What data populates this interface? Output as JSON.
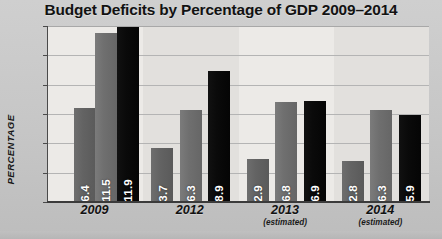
{
  "chart_data": {
    "type": "bar",
    "title": "Budget Deficits by Percentage of GDP 2009–2014",
    "xlabel": "",
    "ylabel": "PERCENTAGE",
    "ylim": [
      0,
      12
    ],
    "yticks": [
      "0",
      "2",
      "4",
      "6",
      "8",
      "10",
      "12"
    ],
    "grid": true,
    "legend": "none",
    "categories": [
      "2009",
      "2012",
      "2013",
      "2014"
    ],
    "category_notes": [
      "",
      "",
      "(estimated)",
      "(estimated)"
    ],
    "series": [
      {
        "name": "series-1",
        "color": "#636363",
        "values": [
          null,
          3.7,
          2.9,
          2.8
        ]
      },
      {
        "name": "series-2",
        "color": "#6f6f6f",
        "values": [
          6.4,
          6.3,
          6.8,
          6.3
        ]
      },
      {
        "name": "series-3",
        "color": "#0a0a0a",
        "values": [
          11.5,
          11.9,
          6.9,
          5.9
        ]
      }
    ],
    "groups": [
      {
        "category": "2009",
        "note": "",
        "bars": [
          {
            "series": "series-1",
            "value": null,
            "label": ""
          },
          {
            "series": "series-1",
            "value": 6.4,
            "label": "6.4",
            "style": "s0"
          },
          {
            "series": "series-2",
            "value": 11.5,
            "label": "11.5",
            "style": "s1"
          },
          {
            "series": "series-3",
            "value": 11.9,
            "label": "11.9",
            "style": "s2"
          }
        ]
      },
      {
        "category": "2012",
        "note": "",
        "bars": [
          {
            "series": "series-1",
            "value": 3.7,
            "label": "3.7",
            "style": "s0"
          },
          {
            "series": "series-2",
            "value": 6.3,
            "label": "6.3",
            "style": "s1"
          },
          {
            "series": "series-3",
            "value": 8.9,
            "label": "8.9",
            "style": "s2"
          }
        ]
      },
      {
        "category": "2013",
        "note": "(estimated)",
        "bars": [
          {
            "series": "series-1",
            "value": 2.9,
            "label": "2.9",
            "style": "s0"
          },
          {
            "series": "series-2",
            "value": 6.8,
            "label": "6.8",
            "style": "s1"
          },
          {
            "series": "series-3",
            "value": 6.9,
            "label": "6.9",
            "style": "s2"
          }
        ]
      },
      {
        "category": "2014",
        "note": "(estimated)",
        "bars": [
          {
            "series": "series-1",
            "value": 2.8,
            "label": "2.8",
            "style": "s0"
          },
          {
            "series": "series-2",
            "value": 6.3,
            "label": "6.3",
            "style": "s1"
          },
          {
            "series": "series-3",
            "value": 5.9,
            "label": "5.9",
            "style": "s2"
          }
        ]
      }
    ]
  },
  "colors": {
    "background": "#c9c9c9",
    "plot_background": "#f2f2f0",
    "gridline": "#b4b4b4",
    "axis": "#3b3b3b",
    "title_text": "#121212",
    "value_label_text": "#ffffff"
  }
}
